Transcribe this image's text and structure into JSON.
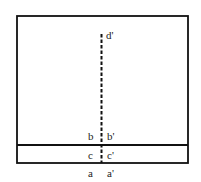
{
  "diagram": {
    "outer_box": {
      "x": 17,
      "y": 16,
      "width": 171,
      "height": 147
    },
    "horizontal_line_y": 145,
    "dashed_line": {
      "x": 101,
      "y_top": 34,
      "y_bottom": 163
    },
    "labels": {
      "d_prime": "d'",
      "b": "b",
      "b_prime": "b'",
      "c": "c",
      "c_prime": "c'",
      "a": "a",
      "a_prime": "a'"
    },
    "colors": {
      "stroke": "#111111",
      "text": "#222222"
    }
  }
}
